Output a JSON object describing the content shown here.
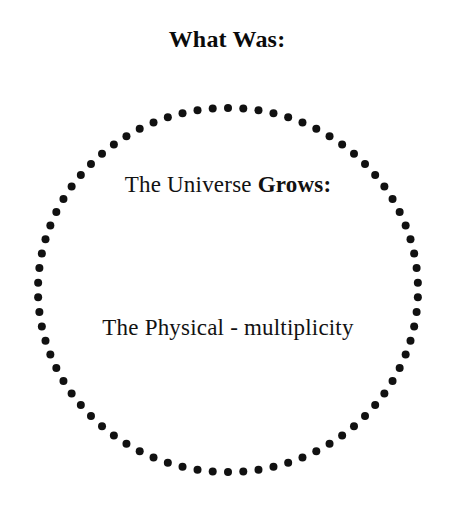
{
  "page": {
    "background_color": "#ffffff",
    "text_color": "#111111",
    "width": 454,
    "height": 513
  },
  "header": {
    "title": "What Was:"
  },
  "diagram": {
    "shape_name": "dotted-circle",
    "shape_label": "dotted circle outline",
    "dot_count": 78,
    "dot_radius_px": 4,
    "dot_color": "#111111",
    "center_x": 196,
    "center_y": 188,
    "radius_x": 190,
    "radius_y": 182,
    "lines": [
      {
        "id": "line-1",
        "segments": [
          {
            "text": "The Universe ",
            "weight": "normal"
          },
          {
            "text": "Grows:",
            "weight": "bold"
          }
        ]
      },
      {
        "id": "line-2",
        "segments": [
          {
            "text": "The Physical - multiplicity",
            "weight": "normal"
          }
        ]
      }
    ],
    "line_1_regular": "The Universe ",
    "line_1_bold": "Grows:",
    "line_2_regular": "The Physical - multiplicity"
  }
}
